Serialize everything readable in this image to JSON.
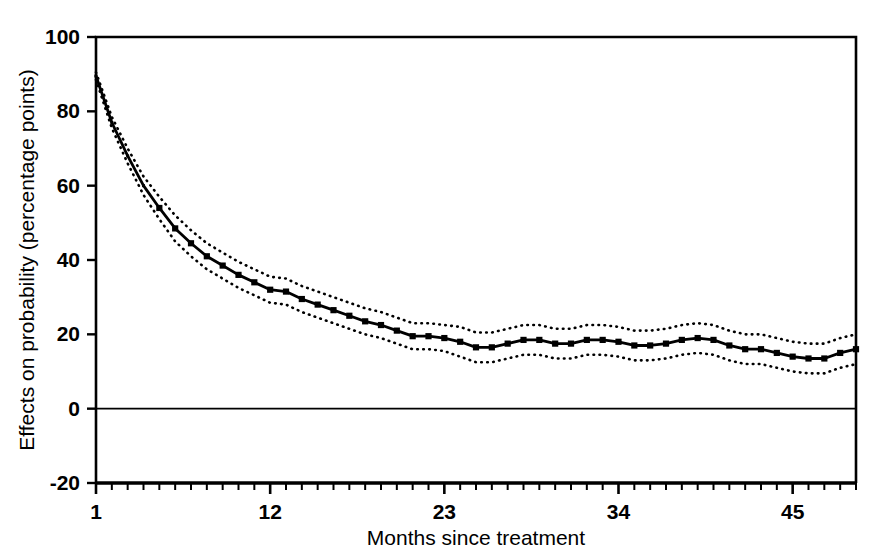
{
  "chart_data": {
    "type": "line",
    "title": "",
    "subtitle": "",
    "xlabel": "Months since treatment",
    "ylabel": "Effects on probability (percentage points)",
    "xlim": [
      1,
      49
    ],
    "ylim": [
      -20,
      100
    ],
    "yticks": [
      -20,
      0,
      20,
      40,
      60,
      80,
      100
    ],
    "ytick_labels": [
      "-20",
      "0",
      "20",
      "40",
      "60",
      "80",
      "100"
    ],
    "xticks": [
      1,
      12,
      23,
      34,
      45
    ],
    "xtick_labels": [
      "1",
      "12",
      "23",
      "34",
      "45"
    ],
    "x_minor_tick_interval": 1,
    "grid": false,
    "legend": null,
    "zero_reference_line": 0,
    "marker": "square",
    "line_style": "solid",
    "ci_line_style": "dotted",
    "x": [
      1,
      2,
      3,
      4,
      5,
      6,
      7,
      8,
      9,
      10,
      11,
      12,
      13,
      14,
      15,
      16,
      17,
      18,
      19,
      20,
      21,
      22,
      23,
      24,
      25,
      26,
      27,
      28,
      29,
      30,
      31,
      32,
      33,
      34,
      35,
      36,
      37,
      38,
      39,
      40,
      41,
      42,
      43,
      44,
      45,
      46,
      47,
      48,
      49
    ],
    "series": [
      {
        "name": "Estimated effect",
        "values": [
          89.5,
          77.0,
          68.0,
          60.0,
          54.0,
          48.5,
          44.5,
          41.0,
          38.5,
          36.0,
          34.0,
          32.0,
          31.5,
          29.5,
          28.0,
          26.5,
          25.0,
          23.5,
          22.5,
          21.0,
          19.5,
          19.5,
          19.0,
          18.0,
          16.5,
          16.5,
          17.5,
          18.5,
          18.5,
          17.5,
          17.5,
          18.5,
          18.5,
          18.0,
          17.0,
          17.0,
          17.5,
          18.5,
          19.0,
          18.5,
          17.0,
          16.0,
          16.0,
          15.0,
          14.0,
          13.5,
          13.5,
          15.0,
          16.0
        ]
      },
      {
        "name": "Upper 95% confidence bound",
        "values": [
          90.5,
          78.5,
          70.0,
          62.5,
          57.0,
          52.0,
          48.0,
          44.5,
          42.0,
          39.5,
          37.5,
          35.5,
          35.0,
          33.0,
          31.5,
          30.0,
          28.5,
          27.0,
          26.0,
          24.5,
          23.0,
          23.0,
          22.5,
          22.0,
          20.5,
          20.5,
          21.5,
          22.5,
          22.5,
          21.5,
          21.5,
          22.5,
          22.5,
          22.0,
          21.0,
          21.0,
          21.5,
          22.5,
          23.0,
          22.5,
          21.0,
          20.0,
          20.0,
          19.0,
          18.0,
          17.5,
          17.5,
          19.0,
          20.0
        ]
      },
      {
        "name": "Lower 95% confidence bound",
        "values": [
          88.5,
          75.5,
          66.0,
          57.5,
          51.0,
          45.0,
          41.0,
          37.5,
          35.0,
          32.5,
          30.5,
          28.5,
          28.0,
          26.0,
          24.5,
          23.0,
          21.5,
          20.0,
          19.0,
          17.5,
          16.0,
          16.0,
          15.5,
          14.0,
          12.5,
          12.5,
          13.5,
          14.5,
          14.5,
          13.5,
          13.5,
          14.5,
          14.5,
          14.0,
          13.0,
          13.0,
          13.5,
          14.5,
          15.0,
          14.5,
          13.0,
          12.0,
          12.0,
          11.0,
          10.0,
          9.5,
          9.5,
          11.0,
          12.0
        ]
      }
    ],
    "colors": {
      "line": "#000000",
      "marker": "#000000",
      "ci": "#000000",
      "axis": "#000000",
      "background": "#ffffff"
    }
  }
}
